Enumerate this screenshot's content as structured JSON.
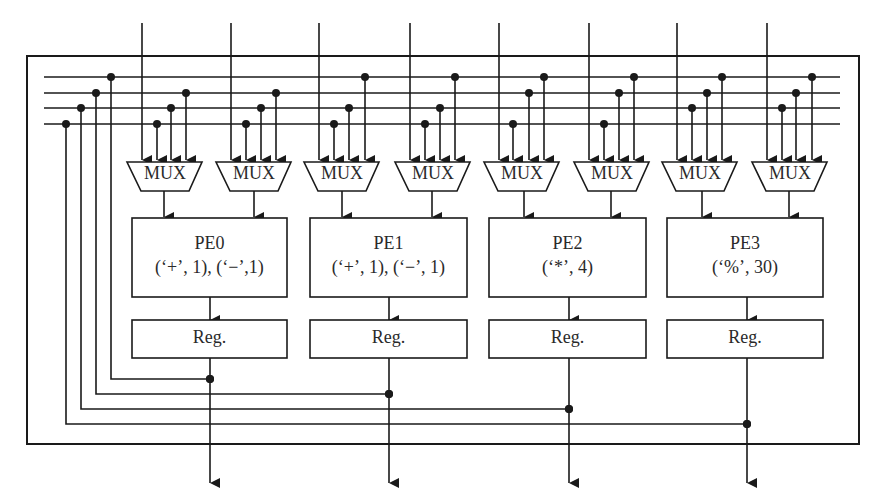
{
  "figure": {
    "mux_label": "MUX",
    "reg_label": "Reg.",
    "pes": [
      {
        "name": "PE0",
        "ops": "(‘+’, 1), (‘−’,1)"
      },
      {
        "name": "PE1",
        "ops": "(‘+’, 1), (‘−’, 1)"
      },
      {
        "name": "PE2",
        "ops": "(‘*’, 4)"
      },
      {
        "name": "PE3",
        "ops": "(‘%’, 30)"
      }
    ],
    "muxes": [
      {
        "label": "MUX",
        "pe": "PE0"
      },
      {
        "label": "MUX",
        "pe": "PE0"
      },
      {
        "label": "MUX",
        "pe": "PE1"
      },
      {
        "label": "MUX",
        "pe": "PE1"
      },
      {
        "label": "MUX",
        "pe": "PE2"
      },
      {
        "label": "MUX",
        "pe": "PE2"
      },
      {
        "label": "MUX",
        "pe": "PE3"
      },
      {
        "label": "MUX",
        "pe": "PE3"
      }
    ],
    "bus_lines": 4,
    "external_inputs": 8,
    "outputs": 4
  }
}
